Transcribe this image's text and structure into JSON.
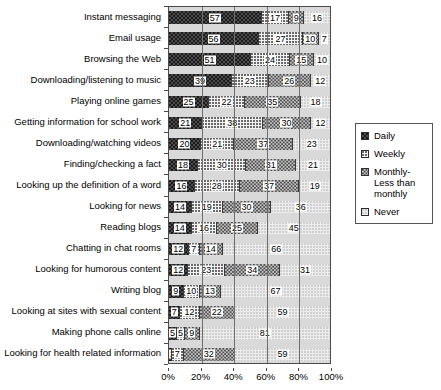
{
  "chart_data": {
    "type": "bar",
    "orientation": "horizontal",
    "stacked": true,
    "stack_mode": "percent",
    "title": "",
    "xlabel": "",
    "ylabel": "",
    "xlim": [
      0,
      100
    ],
    "grid": true,
    "legend_position": "right",
    "xtick_labels": [
      "0%",
      "20%",
      "40%",
      "60%",
      "80%",
      "100%"
    ],
    "xtick_values": [
      0,
      20,
      40,
      60,
      80,
      100
    ],
    "categories": [
      "Instant messaging",
      "Email usage",
      "Browsing the Web",
      "Downloading/listening to music",
      "Playing online games",
      "Getting information for school work",
      "Downloading/watching videos",
      "Finding/checking a fact",
      "Looking up the definition of a word",
      "Looking for news",
      "Reading blogs",
      "Chatting in chat rooms",
      "Looking for humorous content",
      "Writing blog",
      "Looking at sites with sexual content",
      "Making phone calls online",
      "Looking for health related information"
    ],
    "series": [
      {
        "name": "Daily",
        "pattern": "pat-daily",
        "values": [
          57,
          56,
          51,
          39,
          25,
          21,
          20,
          18,
          16,
          14,
          14,
          12,
          12,
          9,
          7,
          5,
          2
        ]
      },
      {
        "name": "Weekly",
        "pattern": "pat-weekly",
        "values": [
          17,
          27,
          24,
          23,
          22,
          38,
          21,
          30,
          28,
          19,
          16,
          7,
          23,
          10,
          12,
          5,
          7
        ]
      },
      {
        "name": "Monthly-Less than monthly",
        "pattern": "pat-monthly",
        "values": [
          9,
          10,
          15,
          26,
          35,
          30,
          37,
          31,
          37,
          30,
          25,
          14,
          34,
          13,
          22,
          9,
          32
        ]
      },
      {
        "name": "Never",
        "pattern": "pat-never",
        "values": [
          16,
          7,
          10,
          12,
          18,
          12,
          23,
          21,
          19,
          36,
          45,
          66,
          31,
          67,
          59,
          81,
          59
        ]
      }
    ]
  },
  "legend": {
    "items": [
      {
        "label": "Daily",
        "pattern": "pat-daily"
      },
      {
        "label": "Weekly",
        "pattern": "pat-weekly"
      },
      {
        "label": "Monthly-Less than monthly",
        "pattern": "pat-monthly"
      },
      {
        "label": "Never",
        "pattern": "pat-never"
      }
    ]
  }
}
